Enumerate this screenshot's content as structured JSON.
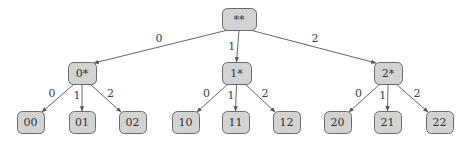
{
  "diagram": {
    "type": "tree",
    "colors": {
      "node_fill": "#d3d3d3",
      "node_stroke": "#6b6b6b",
      "edge": "#555555",
      "text": "#333333"
    },
    "root": {
      "id": "root",
      "label": "**",
      "x": 222,
      "y": 8,
      "w": 34,
      "h": 22
    },
    "level1": [
      {
        "id": "n0",
        "label": "0*",
        "x": 68,
        "y": 62,
        "w": 28,
        "h": 22,
        "edge_label": "0"
      },
      {
        "id": "n1",
        "label": "1*",
        "x": 222,
        "y": 62,
        "w": 29,
        "h": 22,
        "edge_label": "1"
      },
      {
        "id": "n2",
        "label": "2*",
        "x": 374,
        "y": 62,
        "w": 28,
        "h": 22,
        "edge_label": "2"
      }
    ],
    "level2": [
      {
        "id": "n00",
        "parent": "n0",
        "label": "00",
        "x": 17,
        "y": 111,
        "w": 27,
        "h": 22,
        "edge_label": "0"
      },
      {
        "id": "n01",
        "parent": "n0",
        "label": "01",
        "x": 69,
        "y": 111,
        "w": 26,
        "h": 22,
        "edge_label": "1"
      },
      {
        "id": "n02",
        "parent": "n0",
        "label": "02",
        "x": 119,
        "y": 111,
        "w": 27,
        "h": 22,
        "edge_label": "2"
      },
      {
        "id": "n10",
        "parent": "n1",
        "label": "10",
        "x": 172,
        "y": 111,
        "w": 27,
        "h": 22,
        "edge_label": "0"
      },
      {
        "id": "n11",
        "parent": "n1",
        "label": "11",
        "x": 222,
        "y": 111,
        "w": 27,
        "h": 22,
        "edge_label": "1"
      },
      {
        "id": "n12",
        "parent": "n1",
        "label": "12",
        "x": 273,
        "y": 111,
        "w": 27,
        "h": 22,
        "edge_label": "2"
      },
      {
        "id": "n20",
        "parent": "n2",
        "label": "20",
        "x": 324,
        "y": 111,
        "w": 27,
        "h": 22,
        "edge_label": "0"
      },
      {
        "id": "n21",
        "parent": "n2",
        "label": "21",
        "x": 374,
        "y": 111,
        "w": 27,
        "h": 22,
        "edge_label": "1"
      },
      {
        "id": "n22",
        "parent": "n2",
        "label": "22",
        "x": 426,
        "y": 111,
        "w": 27,
        "h": 22,
        "edge_label": "2"
      }
    ]
  }
}
